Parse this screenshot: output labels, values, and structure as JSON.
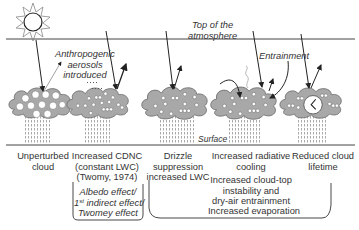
{
  "diagram": {
    "top_label_line1": "Top of the",
    "top_label_line2": "atmosphere",
    "surface_label": "Surface",
    "aerosol_label_line1": "Anthropogenic",
    "aerosol_label_line2": "aerosols",
    "aerosol_label_line3": "introduced",
    "entrainment_label": "Entrainment",
    "icons": [
      "sun-icon",
      "cloud-icon",
      "arrow-icon",
      "clock-icon",
      "rain-icon"
    ],
    "colors": {
      "cloud_fill": "#a8a8a8",
      "cloud_stroke": "#555555",
      "line": "#333333",
      "rain": "#b0b0b0"
    }
  },
  "panels": [
    {
      "caption_line1": "Unperturbed",
      "caption_line2": "cloud"
    },
    {
      "caption_line1": "Increased CDNC",
      "caption_line2": "(constant LWC)",
      "caption_line3": "(Twomy, 1974)"
    },
    {
      "caption_line1": "Drizzle",
      "caption_line2": "suppression",
      "caption_line3": "increased LWC"
    },
    {
      "caption_line1": "Increased radiative",
      "caption_line2": "cooling",
      "caption_line3": "Increased cloud-top",
      "caption_line4": "instability and",
      "caption_line5": "dry-air entrainment"
    },
    {
      "caption_line1": "Reduced cloud",
      "caption_line2": "lifetime"
    }
  ],
  "brackets": {
    "first": {
      "line1": "Albedo effect/",
      "line2_sup": "st",
      "line2_num": "1",
      "line2_rest": " indirect effect/",
      "line3": "Twomey effect"
    },
    "second": {
      "line1": "Increased evaporation"
    }
  }
}
